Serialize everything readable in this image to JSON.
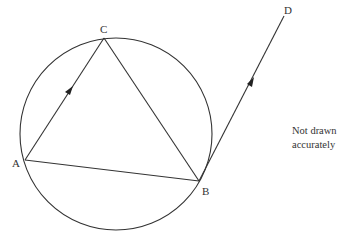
{
  "diagram": {
    "type": "circle-geometry",
    "stroke_color": "#333333",
    "circle": {
      "cx": 116,
      "cy": 134,
      "r": 96
    },
    "points": {
      "A": {
        "label": "A",
        "x": 25,
        "y": 160
      },
      "B": {
        "label": "B",
        "x": 199,
        "y": 181
      },
      "C": {
        "label": "C",
        "x": 104,
        "y": 38
      },
      "D": {
        "label": "D",
        "x": 284,
        "y": 16
      }
    },
    "segments": [
      {
        "from": "A",
        "to": "C",
        "arrow": true
      },
      {
        "from": "C",
        "to": "B",
        "arrow": false
      },
      {
        "from": "A",
        "to": "B",
        "arrow": false
      },
      {
        "from": "B",
        "to": "D",
        "arrow": true
      }
    ],
    "note_lines": [
      "Not drawn",
      "accurately"
    ]
  }
}
